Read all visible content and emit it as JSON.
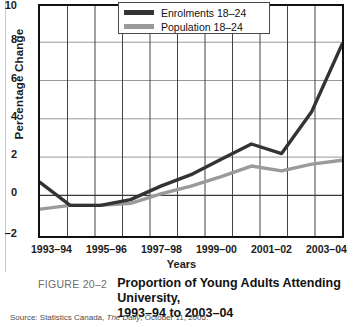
{
  "figure": {
    "number_label": "FIGURE 20–2",
    "title_line1": "Proportion of Young Adults Attending University,",
    "title_line2": "1993–94 to 2003–04",
    "source": "Source: Statistics Canada, ",
    "source_italic": "The Daily",
    "source_tail": ", October 11, 2005."
  },
  "legend": {
    "position": "top-center-inside",
    "items": [
      {
        "label": "Enrolments 18–24",
        "color": "#333333",
        "key": "enrolments"
      },
      {
        "label": "Population 18–24",
        "color": "#9a9a9a",
        "key": "population"
      }
    ]
  },
  "axes": {
    "ylabel": "Percentage Change",
    "xlabel": "Years",
    "yticks": [
      "10",
      "8",
      "6",
      "4",
      "2",
      "0",
      "–2"
    ],
    "xticks_visible": [
      "1993–94",
      "1995–96",
      "1997–98",
      "1999–00",
      "2001–02",
      "2003–04"
    ]
  },
  "chart_data": {
    "type": "line",
    "title": "Proportion of Young Adults Attending University, 1993–94 to 2003–04",
    "xlabel": "Years",
    "ylabel": "Percentage Change",
    "grid": true,
    "legend_position": "top-center",
    "ylim": [
      -2,
      10
    ],
    "ytick_values": [
      -2,
      0,
      2,
      4,
      6,
      8,
      10
    ],
    "categories": [
      "1993–94",
      "1994–95",
      "1995–96",
      "1996–97",
      "1997–98",
      "1998–99",
      "1999–00",
      "2000–01",
      "2001–02",
      "2002–03",
      "2003–04"
    ],
    "series": [
      {
        "name": "Enrolments 18–24",
        "color": "#333333",
        "values": [
          0.8,
          -0.4,
          -0.4,
          -0.1,
          0.6,
          1.2,
          2.0,
          2.8,
          2.3,
          4.5,
          8.0
        ]
      },
      {
        "name": "Population 18–24",
        "color": "#9a9a9a",
        "values": [
          -0.6,
          -0.4,
          -0.4,
          -0.3,
          0.2,
          0.6,
          1.1,
          1.65,
          1.4,
          1.75,
          1.95
        ]
      }
    ]
  }
}
